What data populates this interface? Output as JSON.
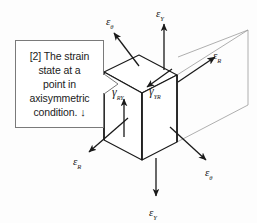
{
  "figure": {
    "title": "Strain state at a point in axisymmetric condition",
    "background_color": "#fdfdfd",
    "line_color": "#1a1a1a",
    "faint_line_color": "#9a9a9a"
  },
  "callout": {
    "line1": "[2] The strain",
    "line2": "state at a",
    "line3": "point in",
    "line4": "axisymmetric",
    "line5": "condition.",
    "arrow_glyph": "↓",
    "border_color": "#7a7a7a",
    "fill_color": "#ffffff"
  },
  "labels": {
    "eps_theta_top": {
      "symbol": "ε",
      "subscript": "θ"
    },
    "eps_y_top": {
      "symbol": "ε",
      "subscript": "Y"
    },
    "eps_r_right": {
      "symbol": "ε",
      "subscript": "R"
    },
    "gamma_ry": {
      "symbol": "γ",
      "subscript": "RY"
    },
    "gamma_yr": {
      "symbol": "γ",
      "subscript": "YR"
    },
    "eps_r_left": {
      "symbol": "ε",
      "subscript": "R"
    },
    "eps_theta_bottom": {
      "symbol": "ε",
      "subscript": "θ"
    },
    "eps_y_bottom": {
      "symbol": "ε",
      "subscript": "Y"
    }
  }
}
